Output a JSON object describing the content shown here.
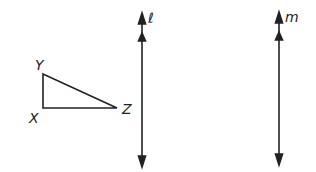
{
  "diagram": {
    "triangle": {
      "vertices": [
        {
          "name": "X",
          "label": "X"
        },
        {
          "name": "Y",
          "label": "Y"
        },
        {
          "name": "Z",
          "label": "Z"
        }
      ]
    },
    "lines": [
      {
        "name": "l",
        "label": "ℓ"
      },
      {
        "name": "m",
        "label": "m"
      }
    ],
    "colors": {
      "stroke": "#222222",
      "background": "#ffffff"
    }
  }
}
